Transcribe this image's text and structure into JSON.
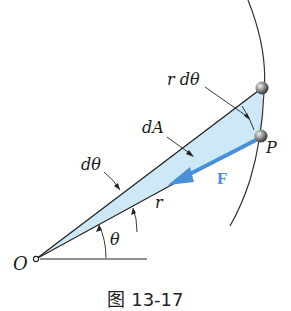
{
  "diagram": {
    "labels": {
      "r_dtheta": "r dθ",
      "dA": "dA",
      "P": "P",
      "F": "F",
      "r": "r",
      "dtheta": "dθ",
      "theta": "θ",
      "O": "O"
    },
    "caption": "图 13-17",
    "colors": {
      "fill": "#cde8f6",
      "force_arrow": "#4a90d9",
      "line": "#222222",
      "particle": "#6e6e6e"
    }
  }
}
